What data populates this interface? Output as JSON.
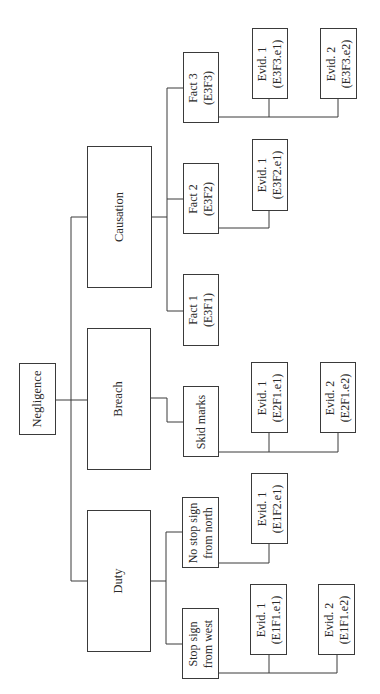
{
  "diagram": {
    "type": "tree",
    "orientation": "rotated-90-ccw",
    "root": {
      "id": "negligence",
      "label": "Negligence"
    },
    "elements": [
      {
        "id": "duty",
        "label": "Duty",
        "facts": [
          {
            "id": "E1F1",
            "line1": "Stop sign",
            "line2": "from west",
            "evidence": [
              {
                "line1": "Evid. 1",
                "line2": "(E1F1.e1)"
              },
              {
                "line1": "Evid. 2",
                "line2": "(E1F1.e2)"
              }
            ]
          },
          {
            "id": "E1F2",
            "line1": "No stop sign",
            "line2": "from north",
            "evidence": [
              {
                "line1": "Evid. 1",
                "line2": "(E1F2.e1)"
              }
            ]
          }
        ]
      },
      {
        "id": "breach",
        "label": "Breach",
        "facts": [
          {
            "id": "E2F1",
            "line1": "Skid marks",
            "line2": "",
            "evidence": [
              {
                "line1": "Evid. 1",
                "line2": "(E2F1.e1)"
              },
              {
                "line1": "Evid. 2",
                "line2": "(E2F1.e2)"
              }
            ]
          }
        ]
      },
      {
        "id": "causation",
        "label": "Causation",
        "facts": [
          {
            "id": "E3F1",
            "line1": "Fact 1",
            "line2": "(E3F1)",
            "evidence": []
          },
          {
            "id": "E3F2",
            "line1": "Fact 2",
            "line2": "(E3F2)",
            "evidence": [
              {
                "line1": "Evid. 1",
                "line2": "(E3F2.e1)"
              }
            ]
          },
          {
            "id": "E3F3",
            "line1": "Fact 3",
            "line2": "(E3F3)",
            "evidence": [
              {
                "line1": "Evid. 1",
                "line2": "(E3F3.e1)"
              },
              {
                "line1": "Evid. 2",
                "line2": "(E3F3.e2)"
              }
            ]
          }
        ]
      }
    ],
    "colors": {
      "line": "#3a3a3a",
      "text": "#2a2a2a",
      "background": "#ffffff"
    }
  }
}
